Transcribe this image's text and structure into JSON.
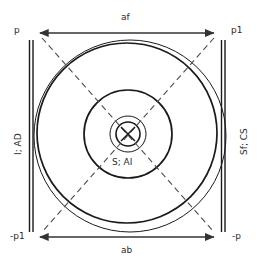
{
  "diagram": {
    "colors": {
      "stroke": "#1a1a1a",
      "arrow": "#333333",
      "dashed": "#4d4d4d",
      "text": "#2b2b2b",
      "background": "#ffffff"
    },
    "corner_labels": {
      "top_left": "p",
      "top_right": "p1",
      "bottom_left": "-p1",
      "bottom_right": "-p"
    },
    "axis_labels": {
      "top_arrow": "af",
      "bottom_arrow": "ab",
      "left_side": "I; AD",
      "right_side": "Sf; CS",
      "center": "S; AI"
    },
    "geometry": {
      "center_x": 128,
      "center_y": 135,
      "left_bar_x": 30,
      "right_bar_x": 224,
      "bar_top_y": 40,
      "bar_bottom_y": 232,
      "top_arrow_y": 33,
      "bottom_arrow_y": 237,
      "arrow_left_x": 38,
      "arrow_right_x": 216,
      "circle_radii": [
        96,
        88,
        44,
        18,
        12
      ]
    }
  }
}
